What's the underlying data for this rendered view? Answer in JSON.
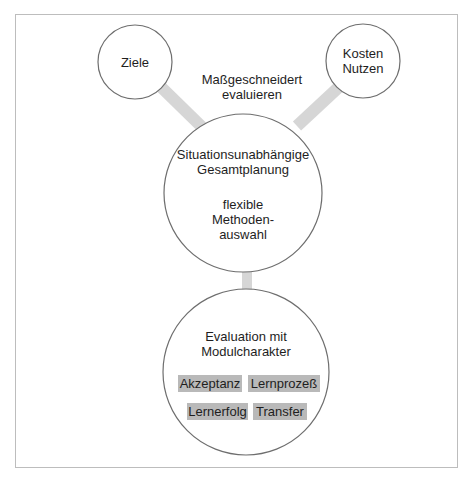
{
  "diagram": {
    "nodes": {
      "ziele": {
        "lines": [
          "Ziele"
        ]
      },
      "kosten_nutzen": {
        "lines": [
          "Kosten",
          "Nutzen"
        ]
      },
      "center": {
        "title_lines": [
          "Situationsunabhängige",
          "Gesamtplanung"
        ],
        "sub_lines": [
          "flexible",
          "Methoden-",
          "auswahl"
        ]
      },
      "bottom": {
        "title_lines": [
          "Evaluation mit",
          "Modulcharakter"
        ],
        "tags": [
          "Akzeptanz",
          "Lernprozeß",
          "Lernerfolg",
          "Transfer"
        ]
      }
    },
    "annotation": {
      "lines": [
        "Maßgeschneidert",
        "evaluieren"
      ]
    },
    "colors": {
      "circle_stroke": "#6e6e6e",
      "connector": "#d6d6d6",
      "tag_fill": "#b9b9b9",
      "frame": "#bdbdbd"
    }
  }
}
